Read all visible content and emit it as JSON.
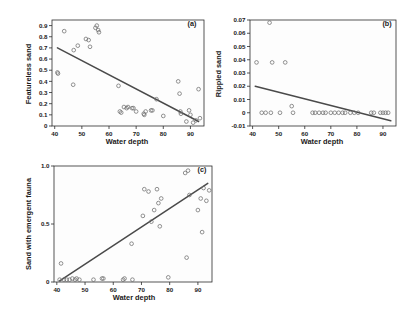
{
  "figure": {
    "background_color": "#ffffff",
    "point_color": "#6e6e6e",
    "line_color": "#4a4a4a",
    "axis_color": "#2b2b2b"
  },
  "chart_data": [
    {
      "type": "scatter",
      "panel": "(a)",
      "title": "",
      "xlabel": "Water depth",
      "ylabel": "Featureless sand",
      "xlim": [
        39,
        95
      ],
      "ylim": [
        0,
        0.95
      ],
      "xticks": [
        40,
        50,
        60,
        70,
        80,
        90
      ],
      "yticks": [
        0,
        0.1,
        0.2,
        0.3,
        0.4,
        0.5,
        0.6,
        0.7,
        0.8,
        0.9
      ],
      "ytick_labels": [
        "0",
        "0.1",
        "0.2",
        "0.3",
        "0.4",
        "0.5",
        "0.6",
        "0.7",
        "0.8",
        "0.9"
      ],
      "xtick_labels": [
        "40",
        "50",
        "60",
        "70",
        "80",
        "90"
      ],
      "grid": false,
      "legend": "none",
      "x": [
        41.0,
        41.2,
        43.5,
        46.8,
        47.0,
        48.5,
        51.5,
        52.5,
        53.0,
        55.0,
        55.5,
        56.0,
        56.3,
        63.5,
        64.0,
        64.5,
        65.5,
        66.5,
        67.0,
        68.5,
        69.0,
        70.0,
        72.8,
        73.0,
        73.5,
        75.5,
        76.0,
        77.5,
        80.0,
        85.5,
        86.0,
        86.3,
        86.5,
        88.5,
        89.5,
        90.0,
        91.0,
        92.0,
        93.0,
        93.5
      ],
      "y": [
        0.48,
        0.47,
        0.85,
        0.37,
        0.68,
        0.72,
        0.78,
        0.77,
        0.71,
        0.88,
        0.9,
        0.86,
        0.84,
        0.36,
        0.13,
        0.12,
        0.17,
        0.16,
        0.17,
        0.16,
        0.16,
        0.13,
        0.11,
        0.1,
        0.13,
        0.14,
        0.14,
        0.24,
        0.09,
        0.4,
        0.29,
        0.13,
        0.11,
        0.04,
        0.14,
        0.1,
        0.03,
        0.05,
        0.33,
        0.07
      ],
      "fit_line": {
        "x0": 41.0,
        "y0": 0.7,
        "x1": 93.0,
        "y1": 0.04
      }
    },
    {
      "type": "scatter",
      "panel": "(b)",
      "title": "",
      "xlabel": "Water depth",
      "ylabel": "Rippled sand",
      "xlim": [
        39,
        95
      ],
      "ylim": [
        -0.01,
        0.07
      ],
      "xticks": [
        40,
        50,
        60,
        70,
        80,
        90
      ],
      "yticks": [
        -0.01,
        0,
        0.01,
        0.02,
        0.03,
        0.04,
        0.05,
        0.06,
        0.07
      ],
      "ytick_labels": [
        "-0.01",
        "0",
        "0.01",
        "0.02",
        "0.03",
        "0.04",
        "0.05",
        "0.06",
        "0.07"
      ],
      "xtick_labels": [
        "40",
        "50",
        "60",
        "70",
        "80",
        "90"
      ],
      "grid": false,
      "legend": "none",
      "x": [
        41.5,
        43.5,
        45.0,
        46.5,
        47.0,
        47.5,
        50.5,
        52.5,
        55.0,
        55.5,
        63.0,
        64.0,
        65.5,
        67.0,
        68.0,
        70.0,
        71.5,
        73.0,
        74.5,
        75.5,
        77.5,
        79.0,
        80.5,
        85.5,
        86.5,
        89.0,
        90.0,
        91.0,
        92.0
      ],
      "y": [
        0.038,
        0.0,
        0.0,
        0.068,
        0.0,
        0.038,
        0.0,
        0.038,
        0.005,
        0.0,
        0.0,
        0.0,
        0.0,
        0.0,
        0.0,
        0.0,
        0.0,
        0.0,
        0.0,
        0.0,
        0.0,
        0.0,
        0.0,
        0.0,
        0.0,
        0.0,
        0.0,
        0.0,
        0.0
      ],
      "fit_line": {
        "x0": 41.0,
        "y0": 0.02,
        "x1": 93.0,
        "y1": -0.006
      }
    },
    {
      "type": "scatter",
      "panel": "(c)",
      "title": "",
      "xlabel": "Water depth",
      "ylabel": "Sand with emergent fauna",
      "xlim": [
        39,
        95
      ],
      "ylim": [
        0,
        1.0
      ],
      "xticks": [
        40,
        50,
        60,
        70,
        80,
        90
      ],
      "yticks": [
        0,
        0.5,
        1.0
      ],
      "ytick_labels": [
        "0",
        "0.5",
        "1.0"
      ],
      "xtick_labels": [
        "40",
        "50",
        "60",
        "70",
        "80",
        "90"
      ],
      "grid": false,
      "legend": "none",
      "x": [
        41.0,
        41.5,
        42.5,
        43.5,
        44.5,
        45.5,
        46.5,
        47.0,
        48.0,
        53.0,
        56.0,
        56.5,
        63.5,
        64.0,
        66.5,
        66.8,
        70.5,
        71.0,
        72.5,
        73.5,
        74.5,
        75.5,
        76.0,
        76.5,
        77.0,
        79.5,
        85.5,
        86.0,
        86.5,
        87.0,
        90.0,
        91.0,
        91.5,
        92.0,
        93.0,
        94.0
      ],
      "y": [
        0.02,
        0.16,
        0.02,
        0.02,
        0.02,
        0.03,
        0.02,
        0.03,
        0.02,
        0.02,
        0.03,
        0.03,
        0.02,
        0.03,
        0.33,
        0.02,
        0.57,
        0.8,
        0.78,
        0.52,
        0.62,
        0.8,
        0.68,
        0.48,
        0.72,
        0.04,
        0.94,
        0.21,
        0.96,
        0.75,
        0.62,
        0.72,
        0.43,
        0.81,
        0.7,
        0.79
      ],
      "fit_line": {
        "x0": 41.0,
        "y0": 0.01,
        "x1": 93.5,
        "y1": 0.85
      }
    }
  ]
}
